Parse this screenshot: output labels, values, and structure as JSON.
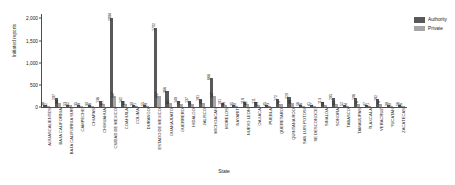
{
  "chart_data": {
    "type": "bar",
    "title": "",
    "xlabel": "State",
    "ylabel": "Initiated reports",
    "ylim": [
      0,
      2100
    ],
    "yticks": [
      "0",
      "500",
      "1,000",
      "1,500",
      "2,000"
    ],
    "ytick_values": [
      0,
      500,
      1000,
      1500,
      2000
    ],
    "grid": false,
    "legend_position": "top-right",
    "categories": [
      "AGUASCALIENTES",
      "BAJA CALIFORNIA",
      "BAJA CALIFORNIA SUR",
      "CAMPECHE",
      "CHIAPAS",
      "CHIHUAHUA",
      "CIUDAD DE MEXICO",
      "COAHUILA",
      "COLIMA",
      "DURANGO",
      "ESTADO DE MEXICO",
      "GUANAJUATO",
      "GUERRERO",
      "HIDALGO",
      "JALISCO",
      "MICHOACAN",
      "MORELOS",
      "NAYARIT",
      "NUEVO LEON",
      "OAXACA",
      "PUEBLA",
      "QUERETARO",
      "QUINTANA ROO",
      "SAN LUIS POTOSI",
      "SE DESCONOCE",
      "SINALOA",
      "SONORA",
      "TABASCO",
      "TAMAULIPAS",
      "TLAXCALA",
      "VERACRUZ",
      "YUCATAN",
      "ZACATECAS"
    ],
    "series": [
      {
        "name": "Authority",
        "color": "#595959",
        "values": [
          36,
          207,
          53,
          35,
          39,
          136,
          2004,
          142,
          39,
          55,
          1792,
          366,
          140,
          137,
          181,
          666,
          101,
          35,
          118,
          111,
          45,
          172,
          229,
          56,
          41,
          113,
          205,
          52,
          196,
          47,
          182,
          38,
          56
        ]
      },
      {
        "name": "Private",
        "color": "#a6a6a6",
        "values": [
          22,
          94,
          42,
          18,
          26,
          61,
          247,
          64,
          21,
          28,
          257,
          82,
          72,
          57,
          93,
          247,
          38,
          19,
          62,
          48,
          23,
          79,
          88,
          26,
          17,
          54,
          69,
          24,
          74,
          21,
          70,
          19,
          26
        ]
      }
    ]
  },
  "legend": {
    "items": [
      {
        "label": "Authority",
        "color": "#595959"
      },
      {
        "label": "Private",
        "color": "#a6a6a6"
      }
    ]
  }
}
